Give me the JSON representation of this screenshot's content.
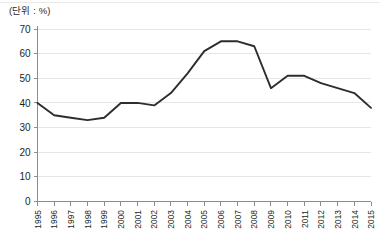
{
  "unit_note": "(단위 : %)",
  "chart_data": {
    "type": "line",
    "title": "",
    "subtitle": "",
    "xlabel": "",
    "ylabel": "",
    "unit": "%",
    "unit_note": "(단위 : %)",
    "grid": true,
    "legend": false,
    "legend_position": "none",
    "line_color": "#2d2d2d",
    "grid_color": "#e6e6e6",
    "axis_color": "#8c8c8c",
    "xlim": [
      1995,
      2015
    ],
    "ylim": [
      0,
      70
    ],
    "y_ticks": [
      0,
      10,
      20,
      30,
      40,
      50,
      60,
      70
    ],
    "y_tick_labels": [
      "0",
      "10",
      "20",
      "30",
      "40",
      "50",
      "60",
      "70"
    ],
    "categories": [
      "1995",
      "1996",
      "1997",
      "1998",
      "1999",
      "2000",
      "2001",
      "2002",
      "2003",
      "2004",
      "2005",
      "2006",
      "2007",
      "2008",
      "2009",
      "2010",
      "2011",
      "2012",
      "2013",
      "2014",
      "2015"
    ],
    "x": [
      1995,
      1996,
      1997,
      1998,
      1999,
      2000,
      2001,
      2002,
      2003,
      2004,
      2005,
      2006,
      2007,
      2008,
      2009,
      2010,
      2011,
      2012,
      2013,
      2014,
      2015
    ],
    "values": [
      40,
      35,
      34,
      33,
      34,
      40,
      40,
      39,
      44,
      52,
      61,
      65,
      65,
      63,
      46,
      51,
      51,
      48,
      46,
      44,
      38
    ],
    "series": [
      {
        "name": "series-1",
        "values": [
          40,
          35,
          34,
          33,
          34,
          40,
          40,
          39,
          44,
          52,
          61,
          65,
          65,
          63,
          46,
          51,
          51,
          48,
          46,
          44,
          38
        ]
      }
    ]
  }
}
